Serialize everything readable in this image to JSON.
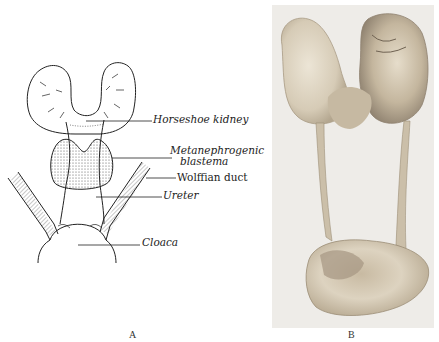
{
  "figure": {
    "panel_a": {
      "label": "A",
      "type": "line-drawing",
      "annotations": [
        {
          "id": "horseshoe-kidney",
          "text": "Horseshoe kidney"
        },
        {
          "id": "metanephrogenic-blastema-1",
          "text": "Metanephrogenic"
        },
        {
          "id": "metanephrogenic-blastema-2",
          "text": "blastema"
        },
        {
          "id": "wolffian-duct",
          "text": "Wolffian duct"
        },
        {
          "id": "ureter",
          "text": "Ureter"
        },
        {
          "id": "cloaca",
          "text": "Cloaca"
        }
      ]
    },
    "panel_b": {
      "label": "B",
      "type": "photograph",
      "subject": "horseshoe kidney specimen with ureters and bladder"
    }
  },
  "colors": {
    "ink": "#222222",
    "photo_bg": "#eeece8",
    "tissue_light": "#e2d9c8",
    "tissue_mid": "#c9bca6",
    "tissue_dark": "#8f8270"
  }
}
